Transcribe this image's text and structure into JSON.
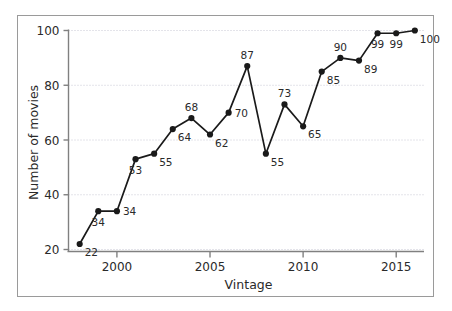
{
  "chart_data": {
    "type": "line",
    "title": "",
    "xlabel": "Vintage",
    "ylabel": "Number of movies",
    "xlim": [
      1997.4,
      2016.6
    ],
    "ylim": [
      16.5,
      103.5
    ],
    "xticks": [
      2000,
      2005,
      2010,
      2015
    ],
    "xtick_labels": [
      "2000",
      "2005",
      "2010",
      "2015"
    ],
    "yticks": [
      20,
      40,
      60,
      80,
      100
    ],
    "ytick_labels": [
      "20",
      "40",
      "60",
      "80",
      "100"
    ],
    "grid": "horizontal-dotted",
    "legend": "none",
    "marker": "filled-circle",
    "line_color": "#1a1a1a",
    "grid_color": "#c8c8d4",
    "axis_color": "#808080",
    "label_color": "#2a2a2a",
    "x": [
      1998,
      1999,
      2000,
      2001,
      2002,
      2003,
      2004,
      2005,
      2006,
      2007,
      2008,
      2009,
      2010,
      2011,
      2012,
      2013,
      2014,
      2015,
      2016
    ],
    "values": [
      22,
      34,
      34,
      53,
      55,
      64,
      68,
      62,
      70,
      87,
      55,
      73,
      65,
      85,
      90,
      89,
      99,
      99,
      100
    ],
    "point_labels": [
      "22",
      "34",
      "34",
      "53",
      "55",
      "64",
      "68",
      "62",
      "70",
      "87",
      "55",
      "73",
      "65",
      "85",
      "90",
      "89",
      "99",
      "99",
      "100"
    ],
    "label_positions": [
      "right-below",
      "below",
      "right",
      "below",
      "right-below",
      "right-below",
      "above",
      "right-below",
      "right",
      "above",
      "right-below",
      "above",
      "right-below",
      "right-below",
      "above",
      "right-below",
      "below",
      "below",
      "right-below"
    ]
  }
}
